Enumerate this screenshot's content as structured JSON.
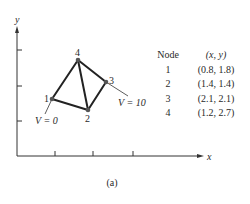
{
  "figure": {
    "caption": "(a)",
    "axes": {
      "x_label": "x",
      "y_label": "y"
    },
    "nodes": [
      {
        "id": "1",
        "label": "1",
        "x": 0.8,
        "y": 1.8
      },
      {
        "id": "2",
        "label": "2",
        "x": 1.4,
        "y": 1.4
      },
      {
        "id": "3",
        "label": "3",
        "x": 2.1,
        "y": 2.1
      },
      {
        "id": "4",
        "label": "4",
        "x": 1.2,
        "y": 2.7
      }
    ],
    "edges": [
      [
        "1",
        "2"
      ],
      [
        "1",
        "4"
      ],
      [
        "2",
        "4"
      ],
      [
        "2",
        "3"
      ],
      [
        "3",
        "4"
      ]
    ],
    "boundary_conditions": [
      {
        "node": "1",
        "label": "V = 0"
      },
      {
        "node": "3",
        "label": "V = 10"
      }
    ]
  },
  "table": {
    "headers": [
      "Node",
      "(x, y)"
    ],
    "rows": [
      [
        "1",
        "(0.8, 1.8)"
      ],
      [
        "2",
        "(1.4, 1.4)"
      ],
      [
        "3",
        "(2.1, 2.1)"
      ],
      [
        "4",
        "(1.2, 2.7)"
      ]
    ]
  }
}
